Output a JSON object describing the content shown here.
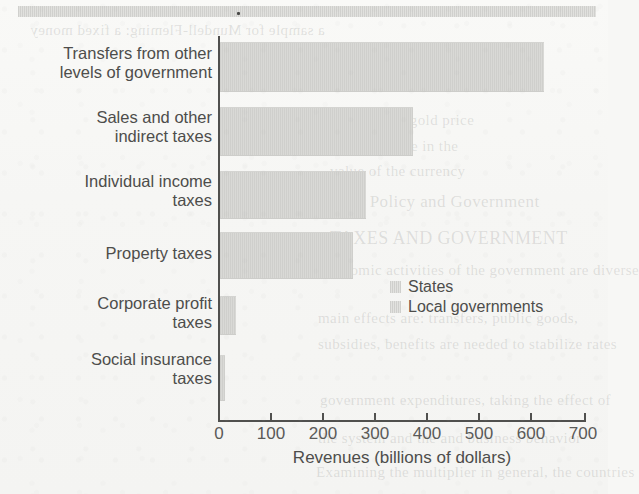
{
  "chart_data": {
    "type": "bar",
    "orientation": "horizontal",
    "title": "",
    "xlabel": "Revenues (billions of dollars)",
    "ylabel": "",
    "xlim": [
      0,
      700
    ],
    "xticks": [
      0,
      100,
      200,
      300,
      400,
      500,
      600,
      700
    ],
    "grid": false,
    "legend_position": "inside-right",
    "categories": [
      "Transfers from other levels of government",
      "Sales and other indirect taxes",
      "Individual income taxes",
      "Property taxes",
      "Corporate profit taxes",
      "Social insurance taxes"
    ],
    "category_lines": [
      [
        "Transfers from other",
        "levels of government"
      ],
      [
        "Sales and other",
        "indirect taxes"
      ],
      [
        "Individual income",
        "taxes"
      ],
      [
        "Property taxes"
      ],
      [
        "Corporate profit",
        "taxes"
      ],
      [
        "Social insurance",
        "taxes"
      ]
    ],
    "values": [
      620,
      370,
      280,
      255,
      30,
      10
    ],
    "series": [
      {
        "name": "Combined state and local revenues",
        "values": [
          620,
          370,
          280,
          255,
          30,
          10
        ]
      }
    ],
    "legend": [
      {
        "label": "States",
        "color": "#cfcfcc"
      },
      {
        "label": "Local governments",
        "color": "#cfcfcc"
      }
    ]
  },
  "axis": {
    "tick_labels": [
      "0",
      "100",
      "200",
      "300",
      "400",
      "500",
      "600",
      "700"
    ],
    "x_title": "Revenues (billions of dollars)"
  },
  "legend": {
    "states_label": "States",
    "local_label": "Local governments"
  },
  "artifacts": {
    "ghost_text": [
      "a sample for Mundell-Fleming: a fixed money",
      "the 1990s, gold price",
      "exchange rate in the",
      "value of the currency",
      "Fiscal Policy and Government",
      "TAXES AND GOVERNMENT",
      "Economic activities of the government are diverse",
      "main effects are: transfers, public goods,",
      "subsidies, benefits are needed to stabilize rates",
      "government expenditures, taking the effect of",
      "the system and the and business behavior",
      "Examining the multiplier in general, the countries"
    ]
  }
}
